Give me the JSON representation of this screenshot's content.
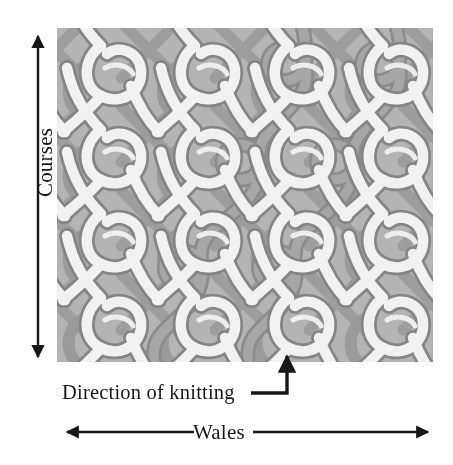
{
  "figure": {
    "background_color": "#ffffff"
  },
  "labels": {
    "courses": "Courses",
    "wales": "Wales",
    "direction_of_knitting": "Direction of knitting"
  },
  "axes": {
    "courses_axis": {
      "label": "Courses",
      "orientation": "vertical",
      "arrow_heads": "both",
      "rotation_deg": -90
    },
    "wales_axis": {
      "label": "Wales",
      "orientation": "horizontal",
      "arrow_heads": "both"
    }
  },
  "leader": {
    "label": "Direction of knitting",
    "style": "elbow",
    "arrow_heads": "one",
    "points_to": "highlighted-yarn-loop"
  },
  "fabric": {
    "structure_type": "warp-knit-tricot",
    "wales_visible": 4,
    "courses_visible": 4,
    "background_color": "#b4b4b4",
    "yarn_light_fill": "#f2f2f0",
    "yarn_light_shade": "#d8d8d6",
    "yarn_dark_fill": "#a3a3a3",
    "yarn_dark_shade": "#8f8f8f",
    "outline_color": "#8a8a8a",
    "highlighted_yarn_color": "#a0a0a0",
    "highlighted_yarn_description": "single continuous yarn traced through the loop structure",
    "wale_spacing_px": 94,
    "course_spacing_px": 84
  },
  "colors": {
    "ink": "#17171a",
    "fabric_bg": "#b4b4b4",
    "yarn_light": "#f2f2f0",
    "yarn_dark": "#a0a0a0",
    "outline": "#8a8a8a"
  }
}
